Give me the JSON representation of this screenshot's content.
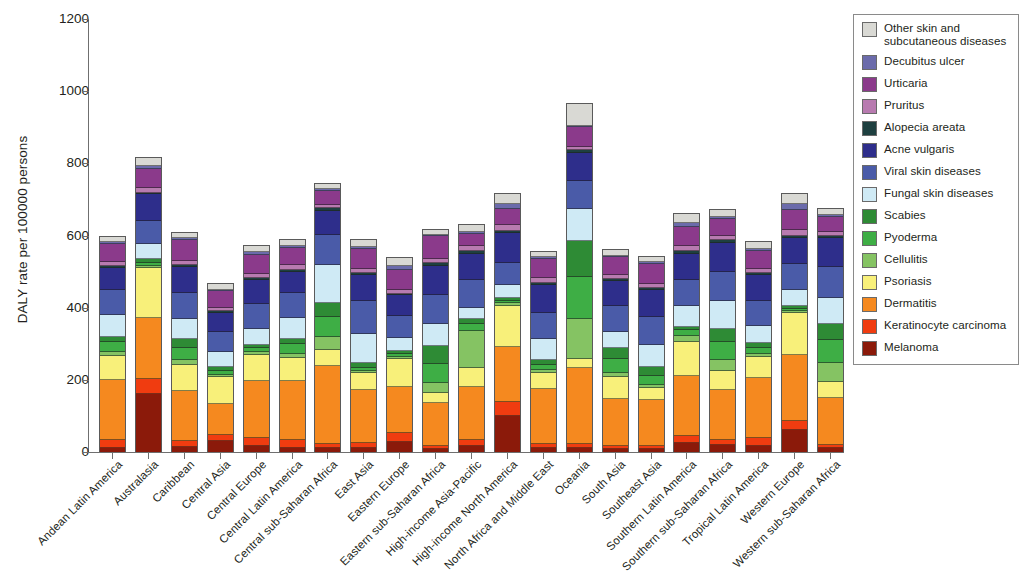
{
  "chart_data": {
    "type": "bar",
    "stacked": true,
    "title": "",
    "xlabel": "",
    "ylabel": "DALY rate per 100000 persons",
    "ylim": [
      0,
      1200
    ],
    "yticks": [
      0,
      200,
      400,
      600,
      800,
      1000,
      1200
    ],
    "grid": false,
    "legend_position": "right",
    "categories": [
      "Andean Latin America",
      "Australasia",
      "Caribbean",
      "Central Asia",
      "Central Europe",
      "Central Latin America",
      "Central sub-Saharan Africa",
      "East Asia",
      "Eastern Europe",
      "Eastern sub-Saharan Africa",
      "High-income Asia-Pacific",
      "High-income North America",
      "North Africa and Middle East",
      "Oceania",
      "South Asia",
      "Southeast Asia",
      "Southern Latin America",
      "Southern sub-Saharan Africa",
      "Tropical Latin America",
      "Western Europe",
      "Western sub-Saharan Africa"
    ],
    "series": [
      {
        "name": "Melanoma",
        "color": "#8b1a0a",
        "values": [
          12,
          160,
          14,
          30,
          18,
          12,
          10,
          10,
          28,
          8,
          18,
          100,
          10,
          10,
          8,
          8,
          26,
          20,
          16,
          62,
          10
        ]
      },
      {
        "name": "Keratinocyte carcinoma",
        "color": "#f03c10",
        "values": [
          22,
          42,
          16,
          18,
          20,
          20,
          12,
          14,
          26,
          8,
          14,
          40,
          12,
          12,
          10,
          10,
          18,
          12,
          24,
          24,
          10
        ]
      },
      {
        "name": "Dermatitis",
        "color": "#f5891f",
        "values": [
          166,
          170,
          140,
          86,
          160,
          166,
          216,
          148,
          126,
          120,
          148,
          152,
          152,
          210,
          130,
          126,
          168,
          140,
          164,
          182,
          130
        ]
      },
      {
        "name": "Psoriasis",
        "color": "#f8f07a",
        "values": [
          66,
          138,
          72,
          74,
          70,
          64,
          46,
          46,
          78,
          28,
          52,
          114,
          46,
          26,
          60,
          34,
          94,
          52,
          60,
          116,
          44
        ]
      },
      {
        "name": "Cellulitis",
        "color": "#85c363",
        "values": [
          10,
          6,
          12,
          6,
          8,
          10,
          34,
          6,
          6,
          26,
          104,
          6,
          8,
          112,
          10,
          8,
          16,
          30,
          8,
          6,
          54
        ]
      },
      {
        "name": "Pyoderma",
        "color": "#3eae45",
        "values": [
          30,
          8,
          34,
          12,
          12,
          28,
          56,
          10,
          8,
          54,
          18,
          8,
          14,
          114,
          40,
          24,
          16,
          50,
          16,
          6,
          62
        ]
      },
      {
        "name": "Scabies",
        "color": "#2e8b35",
        "values": [
          14,
          10,
          24,
          10,
          10,
          14,
          40,
          14,
          8,
          50,
          14,
          8,
          14,
          102,
          30,
          26,
          10,
          36,
          14,
          8,
          44
        ]
      },
      {
        "name": "Fungal skin diseases",
        "color": "#cfeaf5",
        "values": [
          60,
          44,
          58,
          40,
          42,
          58,
          104,
          78,
          36,
          62,
          32,
          34,
          56,
          88,
          44,
          60,
          56,
          78,
          48,
          46,
          72
        ]
      },
      {
        "name": "Viral skin diseases",
        "color": "#4a5ba8",
        "values": [
          68,
          62,
          72,
          56,
          70,
          68,
          84,
          92,
          60,
          78,
          78,
          62,
          74,
          76,
          72,
          78,
          74,
          82,
          70,
          70,
          86
        ]
      },
      {
        "name": "Acne vulgaris",
        "color": "#2e2e8b",
        "values": [
          62,
          74,
          70,
          54,
          66,
          60,
          66,
          72,
          58,
          82,
          72,
          84,
          76,
          78,
          70,
          74,
          72,
          80,
          70,
          74,
          80
        ]
      },
      {
        "name": "Alopecia areata",
        "color": "#1e4040",
        "values": [
          6,
          4,
          6,
          4,
          6,
          6,
          8,
          6,
          4,
          8,
          6,
          6,
          6,
          8,
          6,
          6,
          6,
          8,
          6,
          6,
          8
        ]
      },
      {
        "name": "Pruritus",
        "color": "#b87bb0",
        "values": [
          12,
          14,
          12,
          10,
          12,
          12,
          10,
          12,
          12,
          10,
          14,
          16,
          14,
          10,
          12,
          12,
          14,
          12,
          12,
          16,
          10
        ]
      },
      {
        "name": "Urticaria",
        "color": "#8b3a8b",
        "values": [
          48,
          54,
          58,
          46,
          52,
          48,
          38,
          56,
          56,
          64,
          34,
          44,
          54,
          54,
          48,
          56,
          54,
          46,
          50,
          56,
          42
        ]
      },
      {
        "name": "Decubitus ulcer",
        "color": "#6b6bab",
        "values": [
          6,
          6,
          4,
          4,
          8,
          6,
          4,
          4,
          10,
          4,
          6,
          14,
          4,
          4,
          4,
          4,
          10,
          6,
          6,
          16,
          4
        ]
      },
      {
        "name": "Other skin and subcutaneous diseases",
        "color": "#d9d9d4",
        "values": [
          18,
          26,
          18,
          18,
          20,
          18,
          18,
          22,
          24,
          16,
          22,
          30,
          18,
          62,
          18,
          18,
          28,
          22,
          20,
          30,
          20
        ]
      }
    ],
    "totals": [
      600,
      818,
      610,
      468,
      574,
      590,
      746,
      590,
      540,
      618,
      632,
      718,
      558,
      966,
      562,
      544,
      662,
      674,
      584,
      718,
      676
    ]
  },
  "legend": {
    "entries": [
      {
        "label": "Other skin and subcutaneous diseases",
        "color": "#d9d9d4"
      },
      {
        "label": "Decubitus ulcer",
        "color": "#6b6bab"
      },
      {
        "label": "Urticaria",
        "color": "#8b3a8b"
      },
      {
        "label": "Pruritus",
        "color": "#b87bb0"
      },
      {
        "label": "Alopecia areata",
        "color": "#1e4040"
      },
      {
        "label": "Acne vulgaris",
        "color": "#2e2e8b"
      },
      {
        "label": "Viral skin diseases",
        "color": "#4a5ba8"
      },
      {
        "label": "Fungal skin diseases",
        "color": "#cfeaf5"
      },
      {
        "label": "Scabies",
        "color": "#2e8b35"
      },
      {
        "label": "Pyoderma",
        "color": "#3eae45"
      },
      {
        "label": "Cellulitis",
        "color": "#85c363"
      },
      {
        "label": "Psoriasis",
        "color": "#f8f07a"
      },
      {
        "label": "Dermatitis",
        "color": "#f5891f"
      },
      {
        "label": "Keratinocyte carcinoma",
        "color": "#f03c10"
      },
      {
        "label": "Melanoma",
        "color": "#8b1a0a"
      }
    ]
  }
}
